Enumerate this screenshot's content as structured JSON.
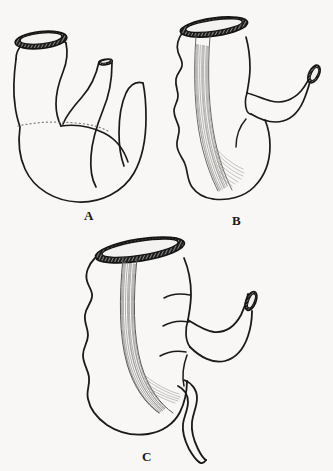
{
  "plate": {
    "background_color": "#f8f7f6",
    "ink_color": "#1a1a1a",
    "width": 333,
    "height": 471,
    "medium": "pen-and-ink line drawing",
    "subject": "three developmental stages of the cecum and vermiform appendix"
  },
  "figures": [
    {
      "id": "A",
      "label": "A",
      "caption_letter": "A",
      "description": "Earliest stage: smooth conical cecum with a short blunt diverticulum; no haustra, no taenia striations, no appendix.",
      "features": [
        "cut proximal opening with hatched rim",
        "short blunt diverticulum with small cut opening",
        "smooth untextured wall",
        "faint stippled constriction line"
      ]
    },
    {
      "id": "B",
      "label": "B",
      "caption_letter": "B",
      "description": "Intermediate stage: elongated sac with lobed left border, a fan-shaped band of longitudinal muscle striations, and a tapering outlet limb.",
      "features": [
        "large tilted cut opening with hatched rim",
        "scalloped haustral left border",
        "longitudinal taenia band of fine striations fanning downward",
        "curved outlet limb with cut end"
      ]
    },
    {
      "id": "C",
      "label": "C",
      "caption_letter": "C",
      "description": "Mature stage: broad haustrated sac with prominent taenia band converging to the base of a slender coiled vermiform appendix.",
      "features": [
        "wide tilted cut opening with hatched rim",
        "four to five haustral lobes on the left border",
        "taenia band of longitudinal striations converging at the appendix base",
        "upturned outlet limb with cut end",
        "slender wavy vermiform appendix with blind rounded tip"
      ]
    }
  ]
}
